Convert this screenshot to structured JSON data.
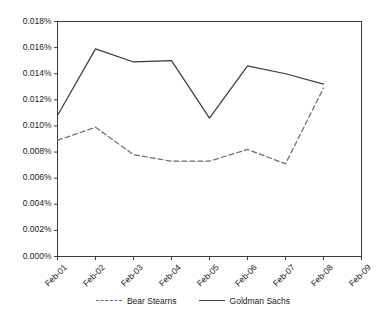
{
  "chart_data": {
    "type": "line",
    "title": "",
    "subtitle": "",
    "xlabel": "",
    "ylabel": "",
    "categories": [
      "Feb-01",
      "Feb-02",
      "Feb-03",
      "Feb-04",
      "Feb-05",
      "Feb-06",
      "Feb-07",
      "Feb-08",
      "Feb-09"
    ],
    "ylim": [
      0.0,
      0.018
    ],
    "yticks": [
      0.0,
      0.002,
      0.004,
      0.006,
      0.008,
      0.01,
      0.012,
      0.014,
      0.016,
      0.018
    ],
    "ytick_labels": [
      "0.000%",
      "0.002%",
      "0.004%",
      "0.006%",
      "0.008%",
      "0.010%",
      "0.012%",
      "0.014%",
      "0.016%",
      "0.018%"
    ],
    "yunit": "%",
    "grid": false,
    "legend_position": "bottom",
    "series": [
      {
        "name": "Bear Stearns",
        "style": "dashed",
        "color": "#6b6b6b",
        "values": [
          0.0089,
          0.0099,
          0.0078,
          0.0073,
          0.0073,
          0.0082,
          0.0071,
          0.0129,
          null
        ]
      },
      {
        "name": "Goldman Sachs",
        "style": "solid",
        "color": "#3a3a3a",
        "values": [
          0.0108,
          0.0159,
          0.0149,
          0.015,
          0.0106,
          0.0146,
          0.014,
          0.0132,
          null
        ]
      }
    ]
  },
  "legend": {
    "entries": [
      {
        "label": "Bear Stearns"
      },
      {
        "label": "Goldman Sachs"
      }
    ]
  },
  "colors": {
    "axis": "#3a3a3a",
    "text": "#1a1a1a",
    "background": "#ffffff"
  }
}
